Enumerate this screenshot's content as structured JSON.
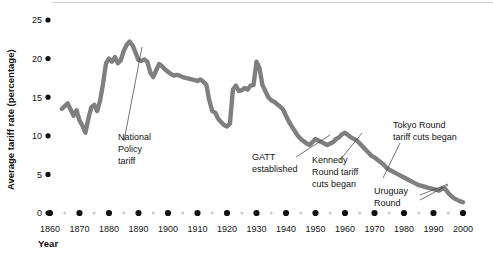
{
  "chart_data": {
    "type": "line",
    "title": "",
    "xlabel": "Year",
    "ylabel": "Average tariff rate (percentage)",
    "xlim": [
      1860,
      2000
    ],
    "ylim": [
      0,
      25
    ],
    "grid": false,
    "legend": "none",
    "line_color": "#7f7f7f",
    "x_ticks": [
      1860,
      1870,
      1880,
      1890,
      1900,
      1910,
      1920,
      1930,
      1940,
      1950,
      1960,
      1970,
      1980,
      1990,
      2000
    ],
    "x_minor_ticks": [
      1865,
      1875,
      1885,
      1895,
      1905,
      1915,
      1925,
      1935,
      1945,
      1955,
      1965,
      1975,
      1985,
      1995
    ],
    "y_ticks": [
      0,
      5,
      10,
      15,
      20,
      25
    ],
    "series": [
      {
        "name": "Average tariff rate",
        "x": [
          1864,
          1866,
          1868,
          1869,
          1870,
          1871,
          1872,
          1873,
          1874,
          1875,
          1876,
          1877,
          1878,
          1879,
          1880,
          1881,
          1882,
          1883,
          1884,
          1885,
          1886,
          1887,
          1888,
          1889,
          1890,
          1891,
          1892,
          1893,
          1894,
          1895,
          1896,
          1897,
          1898,
          1899,
          1900,
          1901,
          1902,
          1903,
          1904,
          1905,
          1906,
          1907,
          1908,
          1909,
          1910,
          1911,
          1912,
          1913,
          1914,
          1915,
          1916,
          1917,
          1918,
          1919,
          1920,
          1921,
          1922,
          1923,
          1924,
          1925,
          1926,
          1927,
          1928,
          1929,
          1930,
          1931,
          1932,
          1933,
          1934,
          1935,
          1936,
          1937,
          1938,
          1939,
          1940,
          1941,
          1942,
          1943,
          1944,
          1945,
          1946,
          1947,
          1948,
          1949,
          1950,
          1951,
          1952,
          1953,
          1954,
          1955,
          1956,
          1957,
          1958,
          1959,
          1960,
          1961,
          1962,
          1963,
          1964,
          1965,
          1966,
          1967,
          1968,
          1969,
          1970,
          1971,
          1972,
          1973,
          1974,
          1975,
          1976,
          1977,
          1978,
          1979,
          1980,
          1981,
          1982,
          1983,
          1984,
          1985,
          1986,
          1987,
          1988,
          1989,
          1990,
          1991,
          1992,
          1993,
          1994,
          1995,
          1996,
          1997,
          1998,
          1999,
          2000
        ],
        "y": [
          13.5,
          14.2,
          12.6,
          13.3,
          12.0,
          11.3,
          10.4,
          12.2,
          13.7,
          14.0,
          13.2,
          14.6,
          16.8,
          19.4,
          20.0,
          19.6,
          20.2,
          19.4,
          19.8,
          21.0,
          21.8,
          22.2,
          21.7,
          20.8,
          19.8,
          19.7,
          19.9,
          19.6,
          18.2,
          17.6,
          18.5,
          19.3,
          19.0,
          18.6,
          18.3,
          18.0,
          17.8,
          17.9,
          17.8,
          17.6,
          17.5,
          17.4,
          17.3,
          17.2,
          17.1,
          17.3,
          17.0,
          16.6,
          14.6,
          13.2,
          13.0,
          12.2,
          11.8,
          11.4,
          11.2,
          11.6,
          16.0,
          16.5,
          15.8,
          15.9,
          16.2,
          16.0,
          16.5,
          16.6,
          19.6,
          18.8,
          16.6,
          15.8,
          15.0,
          14.6,
          14.4,
          14.1,
          13.8,
          13.4,
          12.6,
          11.8,
          11.2,
          10.6,
          10.0,
          9.6,
          9.3,
          9.0,
          8.8,
          9.2,
          9.6,
          9.4,
          9.2,
          9.0,
          8.8,
          9.0,
          9.2,
          9.6,
          9.8,
          10.2,
          10.4,
          10.1,
          9.8,
          9.6,
          9.4,
          9.0,
          8.6,
          8.2,
          7.8,
          7.4,
          7.2,
          6.9,
          6.6,
          6.3,
          5.9,
          5.6,
          5.4,
          5.2,
          5.0,
          4.8,
          4.6,
          4.4,
          4.2,
          4.0,
          3.8,
          3.6,
          3.5,
          3.4,
          3.3,
          3.2,
          3.1,
          3.0,
          2.9,
          3.2,
          3.1,
          2.6,
          2.2,
          1.9,
          1.7,
          1.5,
          1.4
        ]
      }
    ],
    "annotations": [
      {
        "id": "national-policy-tariff",
        "lines": [
          "National",
          "Policy",
          "tariff"
        ],
        "target_year": 1879,
        "target_value": 20.0
      },
      {
        "id": "gatt-established",
        "lines": [
          "GATT",
          "established"
        ],
        "target_year": 1947,
        "target_value": 9.0
      },
      {
        "id": "kennedy-round",
        "lines": [
          "Kennedy",
          "Round tariff",
          "cuts began"
        ],
        "target_year": 1962,
        "target_value": 9.8
      },
      {
        "id": "tokyo-round",
        "lines": [
          "Tokyo Round",
          "tariff cuts began"
        ],
        "target_year": 1974,
        "target_value": 5.9
      },
      {
        "id": "uruguay-round",
        "lines": [
          "Uruguay",
          "Round"
        ],
        "target_year": 1993,
        "target_value": 3.2
      }
    ]
  }
}
